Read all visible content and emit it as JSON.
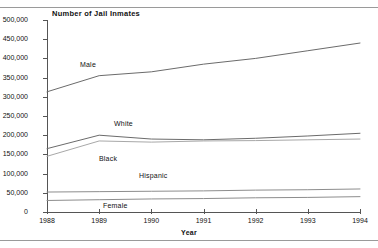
{
  "chart_data": {
    "type": "line",
    "title": "Number of Jail Inmates",
    "xlabel": "Year",
    "ylabel": "",
    "x": [
      1988,
      1989,
      1990,
      1991,
      1992,
      1993,
      1994
    ],
    "categories": [
      "1988",
      "1989",
      "1990",
      "1991",
      "1992",
      "1993",
      "1994"
    ],
    "xlim": [
      1988,
      1994
    ],
    "ylim": [
      0,
      500000
    ],
    "ytick_values": [
      0,
      50000,
      100000,
      150000,
      200000,
      250000,
      300000,
      350000,
      400000,
      450000,
      500000
    ],
    "ytick_labels": [
      "0",
      "50,000",
      "100,000",
      "150,000",
      "200,000",
      "250,000",
      "300,000",
      "350,000",
      "400,000",
      "450,000",
      "500,000"
    ],
    "grid": false,
    "legend": "inline-labels",
    "series": [
      {
        "name": "Male",
        "color": "#6b6b6b",
        "values": [
          313000,
          355000,
          365000,
          385000,
          400000,
          420000,
          440000
        ]
      },
      {
        "name": "White",
        "color": "#6b6b6b",
        "values": [
          165000,
          200000,
          190000,
          188000,
          192000,
          198000,
          205000
        ]
      },
      {
        "name": "Black",
        "color": "#a8a8a8",
        "values": [
          145000,
          185000,
          182000,
          185000,
          186000,
          188000,
          190000
        ]
      },
      {
        "name": "Hispanic",
        "color": "#8d8d8d",
        "values": [
          52000,
          53000,
          54000,
          55000,
          57000,
          58000,
          60000
        ]
      },
      {
        "name": "Female",
        "color": "#8d8d8d",
        "values": [
          30000,
          32000,
          34000,
          35000,
          37000,
          38000,
          40000
        ]
      }
    ],
    "annotations": [
      {
        "text": "Male",
        "x_px": 80,
        "y_px": 61
      },
      {
        "text": "White",
        "x_px": 114,
        "y_px": 120
      },
      {
        "text": "Black",
        "x_px": 99,
        "y_px": 155
      },
      {
        "text": "Hispanic",
        "x_px": 139,
        "y_px": 172
      },
      {
        "text": "Female",
        "x_px": 103,
        "y_px": 202
      }
    ]
  },
  "colors": {
    "background": "#ffffff",
    "axis": "#555555",
    "rule": "#9a9a9a",
    "text": "#111111"
  }
}
